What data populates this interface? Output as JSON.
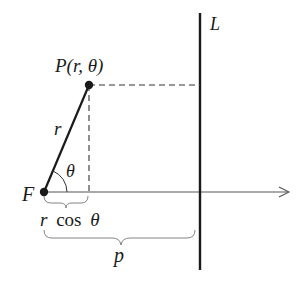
{
  "diagram": {
    "colors": {
      "ink": "#1a1a1a",
      "axis": "#555555",
      "background": "#ffffff"
    },
    "points": {
      "focus": {
        "label": "F",
        "x": 44,
        "y": 192
      },
      "point": {
        "label": "P(r, θ)",
        "x": 89,
        "y": 85
      }
    },
    "lines": {
      "directrix": {
        "label": "L",
        "x": 200,
        "y1": 13,
        "y2": 270
      },
      "polar_axis": {
        "x1": 44,
        "x2": 290,
        "y": 192,
        "arrow": true
      },
      "radius": {
        "label": "r"
      }
    },
    "angle": {
      "label": "θ"
    },
    "braces": {
      "horizontal_projection": {
        "label_italic": "r",
        "label_roman": "cos",
        "label_theta": "θ",
        "text": "r cos θ"
      },
      "distance_to_directrix": {
        "label": "p"
      }
    }
  }
}
